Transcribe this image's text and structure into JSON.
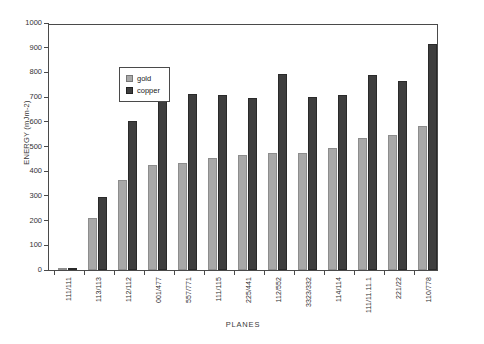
{
  "chart_data": {
    "type": "bar",
    "title": "",
    "xlabel": "PLANES",
    "ylabel": "ENERGY (mJm-2)",
    "ylim": [
      0,
      1000
    ],
    "yticks": [
      0,
      100,
      200,
      300,
      400,
      500,
      600,
      700,
      800,
      900,
      1000
    ],
    "grid": false,
    "legend_position": "upper-left",
    "categories": [
      "111/111",
      "113/113",
      "112/112",
      "001/477",
      "557/771",
      "111/115",
      "225/441",
      "112/552",
      "3323/332",
      "114/114",
      "111/11.11.1",
      "221/22",
      "110/778"
    ],
    "series": [
      {
        "name": "gold",
        "color": "#a8a8a8",
        "values": [
          4,
          210,
          365,
          425,
          435,
          455,
          465,
          475,
          475,
          492,
          535,
          548,
          585
        ]
      },
      {
        "name": "copper",
        "color": "#3e3e3e",
        "values": [
          6,
          295,
          605,
          712,
          712,
          710,
          695,
          792,
          700,
          710,
          790,
          765,
          915
        ]
      }
    ]
  },
  "legend": {
    "items": [
      {
        "label": "gold"
      },
      {
        "label": "copper"
      }
    ]
  },
  "axes": {
    "y_title": "ENERGY (mJm-2)",
    "x_title": "PLANES"
  }
}
